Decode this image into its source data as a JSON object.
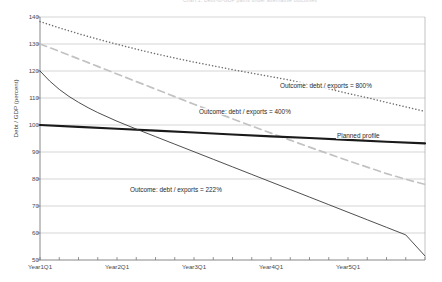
{
  "chart_data": {
    "type": "line",
    "title": "Chart 1. Debt-to-GDP paths under alternative outcomes",
    "xlabel": "",
    "ylabel": "Debt / GDP (percent)",
    "ylim": [
      50,
      140
    ],
    "ytick_values": [
      140,
      130,
      120,
      110,
      100,
      90,
      80,
      70,
      60,
      50
    ],
    "ytick_labels": [
      "140",
      "130",
      "120",
      "110",
      "100",
      "90",
      "80",
      "70",
      "60",
      "50"
    ],
    "xtick_labels": [
      "Year1Q1",
      "Year2Q1",
      "Year3Q1",
      "Year4Q1",
      "Year5Q1"
    ],
    "xtick_positions": [
      0,
      4,
      8,
      12,
      16
    ],
    "x_minor_ticks": 20,
    "xlim": [
      0,
      20
    ],
    "grid": "horizontal",
    "legend": "none",
    "series": [
      {
        "name": "Outcome: debt / exports = 800%",
        "style": "dotted",
        "color": "#6e6e6e",
        "x": [
          0,
          1,
          2,
          3,
          4,
          5,
          6,
          7,
          8,
          9,
          10,
          11,
          12,
          13,
          14,
          15,
          16,
          17,
          18,
          19,
          20
        ],
        "values": [
          138.3,
          136.0,
          133.8,
          131.8,
          129.9,
          128.1,
          126.4,
          124.8,
          123.3,
          121.9,
          120.5,
          119.2,
          117.9,
          116.6,
          115.0,
          113.4,
          111.7,
          110.1,
          108.4,
          106.7,
          105.0
        ]
      },
      {
        "name": "Outcome: debt / exports = 400%",
        "style": "dashed",
        "color": "#c2c2c2",
        "x": [
          0,
          1,
          2,
          3,
          4,
          5,
          6,
          7,
          8,
          9,
          10,
          11,
          12,
          13,
          14,
          15,
          16,
          17,
          18,
          19,
          20
        ],
        "values": [
          130.0,
          127.3,
          124.5,
          121.7,
          118.9,
          116.1,
          113.3,
          110.5,
          107.7,
          105.0,
          102.3,
          99.6,
          97.0,
          94.4,
          91.8,
          89.3,
          86.8,
          84.4,
          82.0,
          79.9,
          78.0
        ]
      },
      {
        "name": "Planned profile",
        "style": "solid-thick",
        "color": "#1a1a1a",
        "x": [
          0,
          2,
          4,
          6,
          8,
          10,
          12,
          14,
          16,
          18,
          20
        ],
        "values": [
          100.0,
          99.3,
          98.6,
          97.9,
          97.2,
          96.5,
          95.8,
          95.2,
          94.5,
          93.8,
          93.2
        ]
      },
      {
        "name": "Outcome: debt / exports = 222%",
        "style": "solid-thin",
        "color": "#3a3a3a",
        "x": [
          0,
          0.5,
          1,
          1.5,
          2,
          2.5,
          3,
          4,
          5,
          6,
          7,
          8,
          9,
          10,
          11,
          12,
          13,
          14,
          15,
          16,
          17,
          18,
          19,
          20
        ],
        "values": [
          120.0,
          116.3,
          113.2,
          110.6,
          108.4,
          106.4,
          104.6,
          101.4,
          98.5,
          95.7,
          92.9,
          90.1,
          87.3,
          84.5,
          81.7,
          78.9,
          76.1,
          73.3,
          70.5,
          67.7,
          64.9,
          62.1,
          59.3,
          51.5
        ]
      }
    ],
    "annotations": [
      {
        "text": "Outcome: debt / exports = 800%",
        "x_px": 279,
        "y_px": 82
      },
      {
        "text": "Outcome: debt / exports = 400%",
        "x_px": 198,
        "y_px": 108
      },
      {
        "text": "Planned profile",
        "x_px": 336,
        "y_px": 132
      },
      {
        "text": "Outcome: debt / exports = 222%",
        "x_px": 129,
        "y_px": 186
      }
    ]
  }
}
